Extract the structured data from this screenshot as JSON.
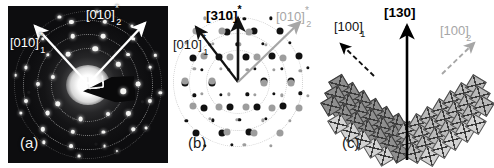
{
  "figure": {
    "type": "three-panel-electron-diffraction-figure",
    "background": "#ffffff",
    "width": 490,
    "height": 168
  },
  "panels": [
    {
      "id": "a",
      "letter": "(a)",
      "kind": "experimental-saed-micrograph",
      "background": "#0d0d0f",
      "description": "Selected-area electron diffraction pattern with bright central transmitted beam, dark beam-stopper wedge and concentric dotted rings of reflections",
      "labels": [
        {
          "name": "axis-010-1",
          "base": "[010]",
          "star": "*",
          "index": "1",
          "color": "#ffffff",
          "weight": "normal"
        },
        {
          "name": "axis-010-2",
          "base": "[010]",
          "star": "*",
          "index": "2",
          "color": "#ffffff",
          "weight": "normal"
        }
      ],
      "arrows": [
        {
          "name": "arrow-010-1",
          "color": "#ffffff",
          "direction": "upper-left"
        },
        {
          "name": "arrow-010-2",
          "color": "#ffffff",
          "direction": "upper-right"
        }
      ]
    },
    {
      "id": "b",
      "letter": "(b)",
      "kind": "simulated-diffraction-pattern",
      "background": "#ffffff",
      "description": "Simulated twin diffraction pattern; black spots belong to variant 1, grey spots to variant 2, dotted circles mark reflection rings",
      "labels": [
        {
          "name": "axis-310-star",
          "base": "[310]",
          "star": "*",
          "index": "",
          "color": "#000000",
          "weight": "bold"
        },
        {
          "name": "axis-010-1",
          "base": "[010]",
          "star": "*",
          "index": "1",
          "color": "#111111",
          "weight": "normal"
        },
        {
          "name": "axis-010-2",
          "base": "[010]",
          "star": "*",
          "index": "2",
          "color": "#a6a6a6",
          "weight": "normal"
        }
      ],
      "arrows": [
        {
          "name": "arrow-310-star",
          "color": "#111111",
          "direction": "up"
        },
        {
          "name": "arrow-010-1",
          "color": "#111111",
          "direction": "upper-left"
        },
        {
          "name": "arrow-010-2",
          "color": "#a6a6a6",
          "direction": "upper-right"
        }
      ],
      "legend": {
        "variant_1_color": "#111111",
        "variant_2_color": "#9d9d9d"
      }
    },
    {
      "id": "c",
      "letter": "(c)",
      "kind": "octahedral-tiling-twin-model",
      "background": "#ffffff",
      "description": "Chevron (V-shaped) twin of corner-sharing octahedra; left wing is variant 1, right wing variant 2, joined on the (130) composition plane",
      "labels": [
        {
          "name": "axis-100-1",
          "base": "[100]",
          "star": "",
          "index": "1",
          "color": "#111111",
          "weight": "normal"
        },
        {
          "name": "axis-130",
          "base": "[130]",
          "star": "",
          "index": "",
          "color": "#000000",
          "weight": "bold"
        },
        {
          "name": "axis-100-2",
          "base": "[100]",
          "star": "",
          "index": "2",
          "color": "#a6a6a6",
          "weight": "normal"
        }
      ],
      "arrows": [
        {
          "name": "arrow-100-1",
          "color": "#111111",
          "direction": "upper-left",
          "style": "dashed"
        },
        {
          "name": "arrow-130",
          "color": "#000000",
          "direction": "up",
          "style": "solid"
        },
        {
          "name": "arrow-100-2",
          "color": "#a6a6a6",
          "direction": "upper-right",
          "style": "dashed"
        }
      ]
    }
  ]
}
